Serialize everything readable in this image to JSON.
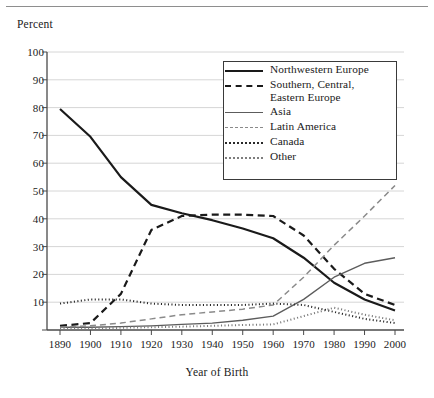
{
  "figure": {
    "y_axis_title": "Percent",
    "x_axis_title": "Year of Birth"
  },
  "chart_data": {
    "type": "line",
    "title": "",
    "subtitle": "",
    "xlabel": "Year of Birth",
    "ylabel": "Percent",
    "xlim": [
      1890,
      2000
    ],
    "ylim": [
      0,
      100
    ],
    "grid": "horizontal",
    "legend_position": "top-right-inside",
    "x": [
      1890,
      1900,
      1910,
      1920,
      1930,
      1940,
      1950,
      1960,
      1970,
      1980,
      1990,
      2000
    ],
    "xticklabels": [
      "1890",
      "1900",
      "1910",
      "1920",
      "1930",
      "1940",
      "1950",
      "1960",
      "1970",
      "1980",
      "1990",
      "2000"
    ],
    "yticks": [
      0,
      10,
      20,
      30,
      40,
      50,
      60,
      70,
      80,
      90,
      100
    ],
    "yticklabels": [
      "0",
      "10",
      "20",
      "30",
      "40",
      "50",
      "60",
      "70",
      "80",
      "90",
      "100"
    ],
    "series": [
      {
        "name": "Northwestern Europe",
        "style": "solid",
        "weight": "thick",
        "color": "#1a1a1a",
        "values": [
          79.5,
          69.5,
          55.0,
          45.0,
          42.0,
          39.5,
          36.5,
          33.0,
          26.0,
          17.0,
          11.0,
          7.0
        ]
      },
      {
        "name": "Southern, Central,\nEastern Europe",
        "name_line1": "Southern, Central,",
        "name_line2": "Eastern Europe",
        "style": "dashed",
        "weight": "thick",
        "color": "#1a1a1a",
        "values": [
          1.5,
          2.5,
          13.0,
          36.0,
          41.0,
          41.5,
          41.5,
          41.0,
          34.0,
          22.0,
          13.0,
          9.0
        ]
      },
      {
        "name": "Asia",
        "style": "solid",
        "weight": "thin",
        "color": "#5c5c5c",
        "values": [
          1.0,
          1.0,
          1.2,
          1.5,
          2.0,
          2.5,
          3.5,
          5.0,
          11.0,
          19.0,
          24.0,
          26.0
        ]
      },
      {
        "name": "Latin America",
        "style": "dashed",
        "weight": "thin",
        "color": "#8a8a8a",
        "values": [
          1.0,
          1.5,
          2.5,
          4.0,
          5.5,
          6.5,
          7.5,
          9.0,
          19.0,
          30.5,
          41.0,
          52.0
        ]
      },
      {
        "name": "Canada",
        "style": "dotted",
        "weight": "medium",
        "color": "#2a2a2a",
        "values": [
          9.5,
          11.0,
          11.0,
          9.5,
          9.0,
          9.0,
          9.0,
          9.5,
          9.0,
          6.5,
          4.0,
          2.5
        ]
      },
      {
        "name": "Other",
        "style": "dotted",
        "weight": "medium",
        "color": "#7d7d7d",
        "values": [
          0.5,
          0.5,
          0.8,
          1.0,
          1.2,
          1.5,
          1.8,
          2.0,
          5.0,
          8.0,
          5.5,
          3.5
        ]
      }
    ],
    "legend_entries": [
      "Northwestern Europe",
      "Southern, Central,\nEastern Europe",
      "Asia",
      "Latin America",
      "Canada",
      "Other"
    ]
  }
}
